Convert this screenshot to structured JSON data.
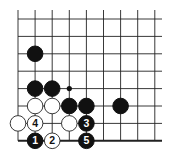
{
  "diagram": {
    "type": "go-board-fragment",
    "columns": 9,
    "rows": 8,
    "bottom_edge": true,
    "stones": [
      {
        "color": "black",
        "col": 1,
        "row": 2,
        "label": ""
      },
      {
        "color": "black",
        "col": 1,
        "row": 4,
        "label": ""
      },
      {
        "color": "black",
        "col": 2,
        "row": 4,
        "label": ""
      },
      {
        "color": "white",
        "col": 1,
        "row": 5,
        "label": ""
      },
      {
        "color": "white",
        "col": 2,
        "row": 5,
        "label": ""
      },
      {
        "color": "black",
        "col": 3,
        "row": 5,
        "label": ""
      },
      {
        "color": "black",
        "col": 4,
        "row": 5,
        "label": ""
      },
      {
        "color": "black",
        "col": 6,
        "row": 5,
        "label": ""
      },
      {
        "color": "white",
        "col": 0,
        "row": 6,
        "label": ""
      },
      {
        "color": "white",
        "col": 1,
        "row": 6,
        "label": "4"
      },
      {
        "color": "white",
        "col": 3,
        "row": 6,
        "label": ""
      },
      {
        "color": "black",
        "col": 4,
        "row": 6,
        "label": "3"
      },
      {
        "color": "black",
        "col": 1,
        "row": 7,
        "label": "1"
      },
      {
        "color": "white",
        "col": 2,
        "row": 7,
        "label": "2"
      },
      {
        "color": "black",
        "col": 4,
        "row": 7,
        "label": "5"
      }
    ],
    "markers": [
      {
        "type": "small-black-dot",
        "col": 3,
        "row": 4
      }
    ],
    "colors": {
      "line": "#222222",
      "black_stone": "#111111",
      "white_stone": "#ffffff",
      "background": "#ffffff"
    }
  }
}
